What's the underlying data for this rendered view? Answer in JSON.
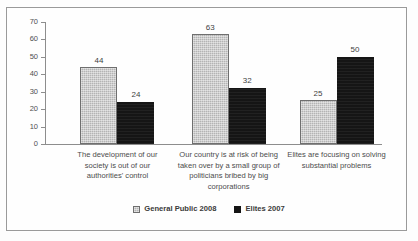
{
  "chart_data": {
    "type": "bar",
    "title": "",
    "subtitle": "",
    "xlabel": "",
    "ylabel": "",
    "ylim": [
      0,
      70
    ],
    "yticks": [
      0,
      10,
      20,
      30,
      40,
      50,
      60,
      70
    ],
    "grid": false,
    "legend_position": "bottom-center",
    "categories": [
      "The development of our society is out of our authorities' control",
      "Our country is at risk of being taken over by a small group of politicians bribed by big corporations",
      "Elites are focusing on solving substantial problems"
    ],
    "category_lines": [
      [
        "The development of our",
        "society is out of our",
        "authorities' control"
      ],
      [
        "Our country is at risk of being",
        "taken over by a small group of",
        "politicians bribed by big",
        "corporations"
      ],
      [
        "Elites are focusing on solving",
        "substantial problems"
      ]
    ],
    "series": [
      {
        "name": "General Public 2008",
        "color": "#b4b4b4",
        "values": [
          44,
          63,
          25
        ]
      },
      {
        "name": "Elites 2007",
        "color": "#151515",
        "values": [
          24,
          32,
          50
        ]
      }
    ]
  },
  "legend": {
    "items": [
      {
        "label": "General Public 2008",
        "swatch": "gray-square-swatch"
      },
      {
        "label": "Elites 2007",
        "swatch": "black-square-swatch"
      }
    ]
  },
  "colors": {
    "general_public": "#b4b4b4",
    "elites": "#151515",
    "axis": "#8d8d8d",
    "frame": "#9a9a9a",
    "text": "#4a4a4a",
    "background": "#fefefe"
  }
}
